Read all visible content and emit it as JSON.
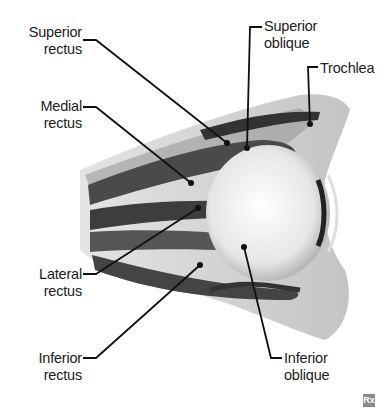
{
  "labels": {
    "superior_rectus": {
      "line1": "Superior",
      "line2": "rectus"
    },
    "medial_rectus": {
      "line1": "Medial",
      "line2": "rectus"
    },
    "lateral_rectus": {
      "line1": "Lateral",
      "line2": "rectus"
    },
    "inferior_rectus": {
      "line1": "Inferior",
      "line2": "rectus"
    },
    "superior_oblique": {
      "line1": "Superior",
      "line2": "oblique"
    },
    "trochlea": {
      "line1": "Trochlea"
    },
    "inferior_oblique": {
      "line1": "Inferior",
      "line2": "oblique"
    }
  },
  "logo": {
    "text": "Rx"
  },
  "colors": {
    "line": "#111111",
    "muscle_dark": "#3a3a3a",
    "tissue": "#bdbdbd",
    "eye": "#f2f2f2"
  }
}
